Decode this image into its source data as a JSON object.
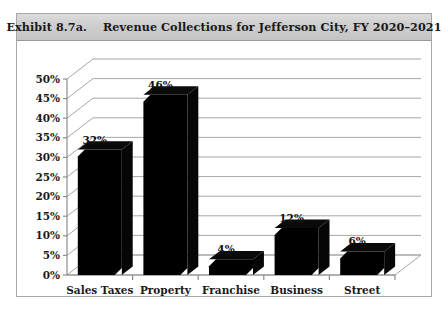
{
  "figure": {
    "title_prefix": "Exhibit 8.7a.",
    "title_text": "Revenue Collections for Jefferson City, FY 2020–2021",
    "title_full": "Exhibit 8.7a.    Revenue Collections for Jefferson City, FY 2020–2021"
  },
  "chart_data": {
    "type": "bar",
    "title": "Revenue Collections for Jefferson City, FY 2020–2021",
    "categories": [
      "Sales Taxes",
      "Property Taxes",
      "Franchise Fees",
      "Business Licenses",
      "Street Meters"
    ],
    "category_lines": [
      [
        "Sales Taxes"
      ],
      [
        "Property",
        "Taxes"
      ],
      [
        "Franchise",
        "Fees"
      ],
      [
        "Business",
        "Licenses"
      ],
      [
        "Street",
        "Meters"
      ]
    ],
    "values": [
      32,
      46,
      4,
      12,
      6
    ],
    "data_labels": [
      "32%",
      "46%",
      "4%",
      "12%",
      "6%"
    ],
    "xlabel": "",
    "ylabel": "",
    "ylim": [
      0,
      50
    ],
    "ytick_step": 5,
    "ytick_labels": [
      "0%",
      "5%",
      "10%",
      "15%",
      "20%",
      "25%",
      "30%",
      "35%",
      "40%",
      "45%",
      "50%"
    ],
    "ytick_values": [
      0,
      5,
      10,
      15,
      20,
      25,
      30,
      35,
      40,
      45,
      50
    ],
    "grid": true,
    "legend": false,
    "three_d": true,
    "bar_color": "#000000",
    "gridline_color": "#a6a6a6",
    "axis_color": "#8c8c8c"
  }
}
